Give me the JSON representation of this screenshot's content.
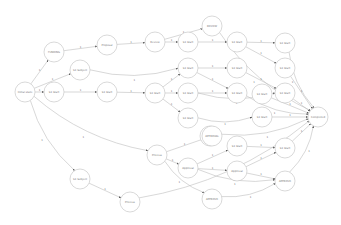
{
  "colors": {
    "node_stroke": "#c8c8c8",
    "node_fill": "#ffffff",
    "edge": "#bdbdbd",
    "text": "#777777",
    "arrow": "#555555"
  },
  "nodes": [
    {
      "id": "A",
      "label": "Initial state",
      "x": 25,
      "y": 92
    },
    {
      "id": "B",
      "label": "FUNDING",
      "x": 54,
      "y": 52
    },
    {
      "id": "C",
      "label": "S1 Subject",
      "x": 80,
      "y": 70
    },
    {
      "id": "D",
      "label": "S1 Start",
      "x": 54,
      "y": 92
    },
    {
      "id": "E",
      "label": "Proposal",
      "x": 107,
      "y": 45
    },
    {
      "id": "F",
      "label": "S1 Start",
      "x": 107,
      "y": 92
    },
    {
      "id": "G",
      "label": "Review",
      "x": 155,
      "y": 42
    },
    {
      "id": "H",
      "label": "REVIEW",
      "x": 212,
      "y": 26
    },
    {
      "id": "I",
      "label": "S1 Start",
      "x": 188,
      "y": 42
    },
    {
      "id": "J",
      "label": "S1 Start",
      "x": 237,
      "y": 42
    },
    {
      "id": "Q",
      "label": "S1 Start",
      "x": 285,
      "y": 43
    },
    {
      "id": "K",
      "label": "S1 Start",
      "x": 188,
      "y": 68
    },
    {
      "id": "L",
      "label": "S1 Start",
      "x": 237,
      "y": 68
    },
    {
      "id": "R",
      "label": "S1 Start",
      "x": 285,
      "y": 68
    },
    {
      "id": "M",
      "label": "S1 Start",
      "x": 155,
      "y": 93
    },
    {
      "id": "N",
      "label": "S1 Start",
      "x": 188,
      "y": 93
    },
    {
      "id": "S",
      "label": "S1 Start",
      "x": 237,
      "y": 93
    },
    {
      "id": "T",
      "label": "S1 Start",
      "x": 262,
      "y": 94
    },
    {
      "id": "U",
      "label": "S1 Start",
      "x": 285,
      "y": 93
    },
    {
      "id": "O",
      "label": "S1 Start",
      "x": 188,
      "y": 118
    },
    {
      "id": "V",
      "label": "S1 Start",
      "x": 262,
      "y": 117
    },
    {
      "id": "Z",
      "label": "Completed",
      "x": 318,
      "y": 117
    },
    {
      "id": "P",
      "label": "APPROVAL",
      "x": 210,
      "y": 136
    },
    {
      "id": "W",
      "label": "Process",
      "x": 157,
      "y": 155
    },
    {
      "id": "X",
      "label": "APPROVAL",
      "x": 212,
      "y": 136
    },
    {
      "id": "Y",
      "label": "Approval",
      "x": 188,
      "y": 168
    },
    {
      "id": "AA",
      "label": "S1 Start",
      "x": 237,
      "y": 146
    },
    {
      "id": "AB",
      "label": "Approval",
      "x": 237,
      "y": 171
    },
    {
      "id": "AC",
      "label": "S1 Start",
      "x": 285,
      "y": 148
    },
    {
      "id": "AD",
      "label": "APPROVE",
      "x": 285,
      "y": 181
    },
    {
      "id": "AE",
      "label": "APPROVE",
      "x": 212,
      "y": 199
    },
    {
      "id": "AG",
      "label": "S1 Subject",
      "x": 80,
      "y": 179
    },
    {
      "id": "AF",
      "label": "Process",
      "x": 130,
      "y": 202
    }
  ],
  "edges": [
    {
      "from": "A",
      "to": "B",
      "label": "1"
    },
    {
      "from": "A",
      "to": "C",
      "label": "1"
    },
    {
      "from": "A",
      "to": "D",
      "label": "1"
    },
    {
      "from": "A",
      "to": "W",
      "label": "1"
    },
    {
      "from": "A",
      "to": "AG",
      "label": "1"
    },
    {
      "from": "B",
      "to": "E",
      "label": "1"
    },
    {
      "from": "E",
      "to": "G",
      "label": "1"
    },
    {
      "from": "C",
      "to": "K",
      "label": "1"
    },
    {
      "from": "D",
      "to": "F",
      "label": "1"
    },
    {
      "from": "F",
      "to": "M",
      "label": "1"
    },
    {
      "from": "G",
      "to": "I",
      "label": "1"
    },
    {
      "from": "G",
      "to": "H",
      "label": "1"
    },
    {
      "from": "H",
      "to": "Z",
      "label": "1"
    },
    {
      "from": "I",
      "to": "J",
      "label": "1"
    },
    {
      "from": "J",
      "to": "Q",
      "label": "1"
    },
    {
      "from": "J",
      "to": "R",
      "label": "1"
    },
    {
      "from": "Q",
      "to": "Z",
      "label": "1"
    },
    {
      "from": "K",
      "to": "L",
      "label": "1"
    },
    {
      "from": "K",
      "to": "S",
      "label": "1"
    },
    {
      "from": "L",
      "to": "U",
      "label": "1"
    },
    {
      "from": "R",
      "to": "Z",
      "label": "1"
    },
    {
      "from": "M",
      "to": "K",
      "label": "1"
    },
    {
      "from": "M",
      "to": "N",
      "label": "1"
    },
    {
      "from": "M",
      "to": "O",
      "label": "1"
    },
    {
      "from": "N",
      "to": "S",
      "label": "1"
    },
    {
      "from": "N",
      "to": "U",
      "label": "1"
    },
    {
      "from": "S",
      "to": "Z",
      "label": "1"
    },
    {
      "from": "T",
      "to": "Z",
      "label": "1"
    },
    {
      "from": "U",
      "to": "Z",
      "label": "1"
    },
    {
      "from": "O",
      "to": "V",
      "label": "1"
    },
    {
      "from": "V",
      "to": "Z",
      "label": "1"
    },
    {
      "from": "W",
      "to": "X",
      "label": "1"
    },
    {
      "from": "W",
      "to": "Y",
      "label": "1"
    },
    {
      "from": "W",
      "to": "AE",
      "label": "1"
    },
    {
      "from": "X",
      "to": "Z",
      "label": "1"
    },
    {
      "from": "Y",
      "to": "AA",
      "label": "1"
    },
    {
      "from": "Y",
      "to": "AB",
      "label": "1"
    },
    {
      "from": "Y",
      "to": "AD",
      "label": "1"
    },
    {
      "from": "AA",
      "to": "AC",
      "label": "1"
    },
    {
      "from": "AB",
      "to": "AC",
      "label": "1"
    },
    {
      "from": "AB",
      "to": "AD",
      "label": "1"
    },
    {
      "from": "AC",
      "to": "Z",
      "label": "1"
    },
    {
      "from": "AD",
      "to": "Z",
      "label": "1"
    },
    {
      "from": "AE",
      "to": "AD",
      "label": "1"
    },
    {
      "from": "AG",
      "to": "AF",
      "label": "1"
    },
    {
      "from": "AF",
      "to": "Z",
      "label": "1"
    }
  ]
}
